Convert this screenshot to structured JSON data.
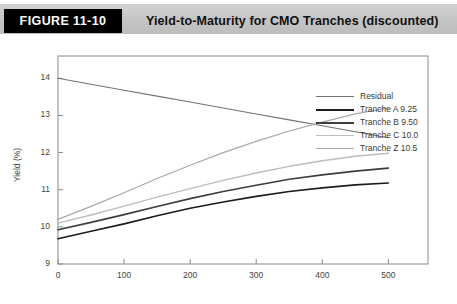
{
  "header": {
    "figure_tag": "FIGURE 11-10",
    "title": "Yield-to-Maturity for CMO Tranches (discounted)",
    "tag_bg": "#000000",
    "band_bg": "#c4c4c4"
  },
  "chart_data": {
    "type": "line",
    "title": "Yield-to-Maturity for CMO Tranches (discounted)",
    "xlabel": "PSA (90)",
    "ylabel": "Yield (%)",
    "xlim": [
      0,
      560
    ],
    "ylim": [
      9,
      14.6
    ],
    "xticks": [
      0,
      100,
      200,
      300,
      400,
      500
    ],
    "yticks": [
      9,
      10,
      11,
      12,
      13,
      14
    ],
    "grid": false,
    "legend_position": "top-right",
    "x": [
      0,
      50,
      100,
      150,
      200,
      250,
      300,
      350,
      400,
      450,
      500
    ],
    "series": [
      {
        "name": "Residual",
        "color": "#737373",
        "width": 1.1,
        "values": [
          14.0,
          13.84,
          13.68,
          13.52,
          13.36,
          13.2,
          13.04,
          12.88,
          12.72,
          12.56,
          12.4
        ]
      },
      {
        "name": "Tranche A 9.25",
        "color": "#1c1c1c",
        "width": 1.6,
        "values": [
          9.68,
          9.88,
          10.08,
          10.3,
          10.5,
          10.67,
          10.82,
          10.95,
          11.05,
          11.13,
          11.18
        ]
      },
      {
        "name": "Tranche B 9.50",
        "color": "#3d3d3d",
        "width": 1.6,
        "values": [
          9.92,
          10.12,
          10.33,
          10.55,
          10.76,
          10.95,
          11.12,
          11.28,
          11.4,
          11.5,
          11.58
        ]
      },
      {
        "name": "Tranche C 10.0",
        "color": "#bdbdbd",
        "width": 1.4,
        "values": [
          10.1,
          10.32,
          10.56,
          10.8,
          11.03,
          11.25,
          11.45,
          11.63,
          11.78,
          11.9,
          11.98
        ]
      },
      {
        "name": "Tranche Z 10.5",
        "color": "#a8a8a8",
        "width": 1.2,
        "values": [
          10.2,
          10.55,
          10.92,
          11.3,
          11.66,
          12.0,
          12.3,
          12.58,
          12.82,
          13.04,
          13.2
        ]
      }
    ]
  }
}
